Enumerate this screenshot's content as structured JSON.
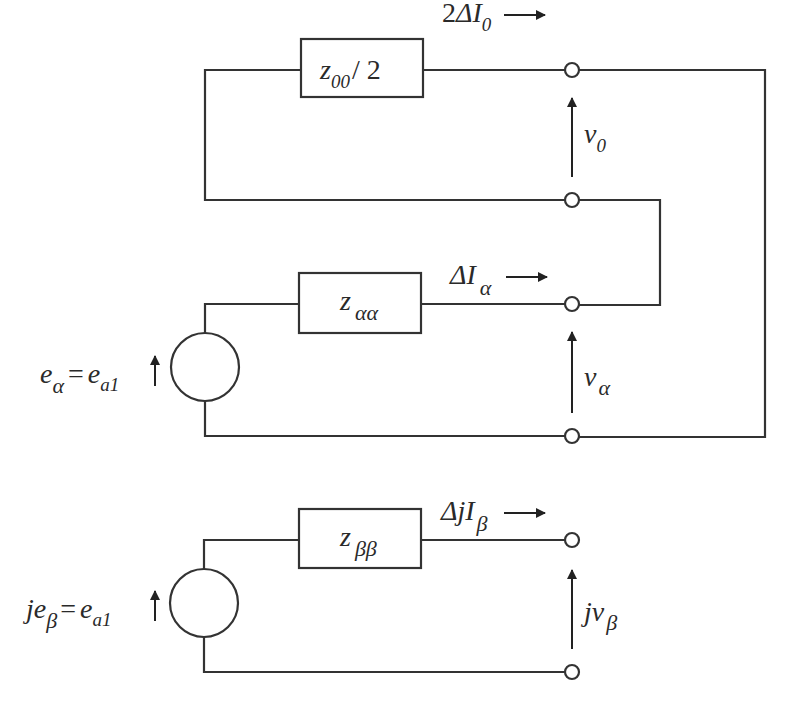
{
  "diagram": {
    "type": "equivalent-circuit",
    "top_loop": {
      "impedance": {
        "main": "z",
        "sub": "00",
        "suffix": "/ 2"
      },
      "current": {
        "prefix": "2",
        "main": "ΔI",
        "sub": "0"
      },
      "voltage": {
        "main": "v",
        "sub": "0"
      }
    },
    "alpha_circuit": {
      "impedance": {
        "main": "z",
        "sub": "αα"
      },
      "current": {
        "main": "ΔI",
        "sub": "α"
      },
      "voltage": {
        "main": "v",
        "sub": "α"
      },
      "source": {
        "lhs_main": "e",
        "lhs_sub": "α",
        "eq": "=",
        "rhs_main": "e",
        "rhs_sub": "a1"
      }
    },
    "beta_circuit": {
      "impedance": {
        "main": "z",
        "sub": "ββ"
      },
      "current": {
        "main": "ΔjI",
        "sub": "β"
      },
      "voltage": {
        "main": "jv",
        "sub": "β"
      },
      "source": {
        "lhs_main": "je",
        "lhs_sub": "β",
        "eq": "=",
        "rhs_main": "e",
        "rhs_sub": "a1"
      }
    }
  }
}
